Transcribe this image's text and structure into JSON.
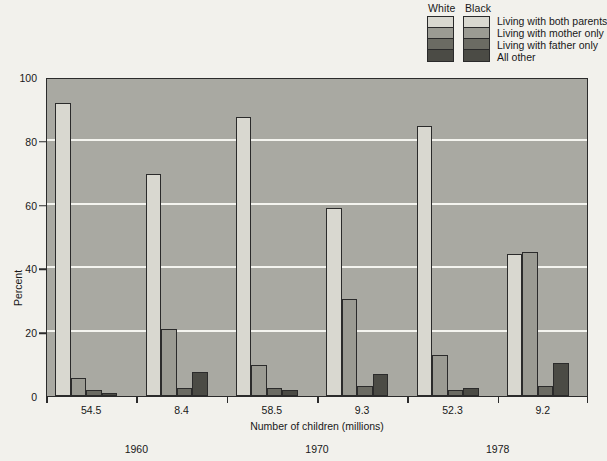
{
  "legend": {
    "column_headers": [
      "White",
      "Black"
    ],
    "labels": [
      "Living with both parents",
      "Living with mother only",
      "Living with father only",
      "All other"
    ],
    "swatch_colors": [
      "#d9d8d0",
      "#9b9b93",
      "#6b6b63",
      "#4b4b45"
    ]
  },
  "chart_data": {
    "type": "bar",
    "title": "",
    "xlabel": "Number of children (millions)",
    "ylabel": "Percent",
    "ylim": [
      0,
      100
    ],
    "yticks": [
      0,
      20,
      40,
      60,
      80,
      100
    ],
    "grid": true,
    "legend_position": "top-right",
    "categories": [
      "54.5",
      "8.4",
      "58.5",
      "9.3",
      "52.3",
      "9.2"
    ],
    "group_labels": [
      {
        "label": "1960",
        "categories": [
          "54.5",
          "8.4"
        ]
      },
      {
        "label": "1970",
        "categories": [
          "58.5",
          "9.3"
        ]
      },
      {
        "label": "1978",
        "categories": [
          "52.3",
          "9.2"
        ]
      }
    ],
    "category_race": [
      "White",
      "Black",
      "White",
      "Black",
      "White",
      "Black"
    ],
    "series": [
      {
        "name": "Living with both parents",
        "color": "#d9d8d0",
        "values": [
          92.0,
          69.5,
          87.5,
          59.0,
          84.5,
          44.5
        ]
      },
      {
        "name": "Living with mother only",
        "color": "#9b9b93",
        "values": [
          5.8,
          21.0,
          9.6,
          30.5,
          13.0,
          45.0
        ]
      },
      {
        "name": "Living with father only",
        "color": "#6b6b63",
        "values": [
          2.0,
          2.5,
          2.5,
          3.0,
          2.0,
          3.0
        ]
      },
      {
        "name": "All other",
        "color": "#4b4b45",
        "values": [
          1.0,
          7.5,
          2.0,
          7.0,
          2.5,
          10.5
        ]
      }
    ]
  },
  "colors": {
    "page_background": "#f2f1ec",
    "plot_background": "#a9a9a2",
    "gridline": "#f4f4ef",
    "axis": "#2b2b2b"
  }
}
